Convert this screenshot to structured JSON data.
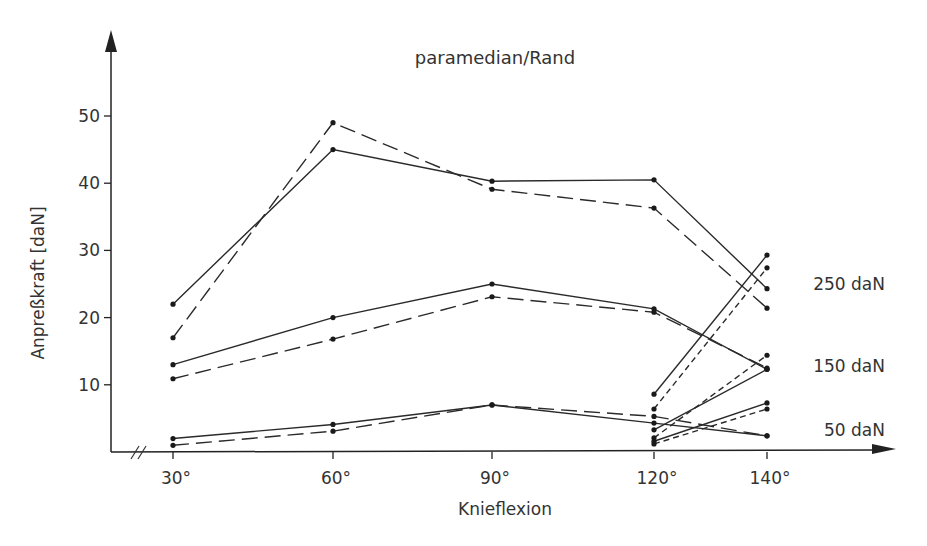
{
  "chart_data": {
    "type": "line",
    "title": "paramedian/Rand",
    "xlabel": "Knieflexion",
    "ylabel": "Anpreßkraft [daN]",
    "x_categories": [
      "30°",
      "60°",
      "90°",
      "120°",
      "140°"
    ],
    "x": [
      30,
      60,
      90,
      120,
      140
    ],
    "yticks": [
      10,
      20,
      30,
      40,
      50
    ],
    "ylim": [
      0,
      58
    ],
    "grid": false,
    "axis_break_x": true,
    "load_labels": [
      {
        "text": "250 daN",
        "y": 25
      },
      {
        "text": "150 daN",
        "y": 12.8
      },
      {
        "text": "50 daN",
        "y": 3.3
      }
    ],
    "series": [
      {
        "name": "250 daN paramedian (solid)",
        "group": "250 daN",
        "style": "solid",
        "x": [
          30,
          60,
          90,
          120,
          140
        ],
        "values": [
          22.0,
          45.0,
          40.3,
          40.5,
          24.3
        ]
      },
      {
        "name": "250 daN paramedian (long dash)",
        "group": "250 daN",
        "style": "longdash",
        "x": [
          30,
          60,
          90,
          120,
          140
        ],
        "values": [
          17.0,
          49.0,
          39.1,
          36.3,
          21.4
        ]
      },
      {
        "name": "150 daN paramedian (solid)",
        "group": "150 daN",
        "style": "solid",
        "x": [
          30,
          60,
          90,
          120,
          140
        ],
        "values": [
          13.0,
          20.0,
          25.0,
          21.3,
          12.3
        ]
      },
      {
        "name": "150 daN paramedian (long dash)",
        "group": "150 daN",
        "style": "longdash",
        "x": [
          30,
          60,
          90,
          120,
          140
        ],
        "values": [
          10.9,
          16.8,
          23.1,
          20.8,
          12.5
        ]
      },
      {
        "name": "50 daN paramedian (solid)",
        "group": "50 daN",
        "style": "solid",
        "x": [
          30,
          60,
          90,
          120,
          140
        ],
        "values": [
          2.0,
          4.1,
          7.0,
          4.3,
          2.4
        ]
      },
      {
        "name": "50 daN paramedian (long dash)",
        "group": "50 daN",
        "style": "longdash",
        "x": [
          30,
          60,
          90,
          120,
          140
        ],
        "values": [
          1.0,
          3.1,
          7.0,
          5.3,
          2.4
        ]
      },
      {
        "name": "250 daN Rand (solid)",
        "group": "250 daN",
        "style": "solid",
        "x": [
          120,
          140
        ],
        "values": [
          8.6,
          29.3
        ]
      },
      {
        "name": "250 daN Rand (short dash)",
        "group": "250 daN",
        "style": "shortdash",
        "x": [
          120,
          140
        ],
        "values": [
          6.4,
          27.4
        ]
      },
      {
        "name": "150 daN Rand (solid)",
        "group": "150 daN",
        "style": "solid",
        "x": [
          120,
          140
        ],
        "values": [
          3.3,
          12.3
        ]
      },
      {
        "name": "150 daN Rand (short dash)",
        "group": "150 daN",
        "style": "shortdash",
        "x": [
          120,
          140
        ],
        "values": [
          2.1,
          14.4
        ]
      },
      {
        "name": "50 daN Rand (solid)",
        "group": "50 daN",
        "style": "solid",
        "x": [
          120,
          140
        ],
        "values": [
          1.6,
          7.3
        ]
      },
      {
        "name": "50 daN Rand (short dash)",
        "group": "50 daN",
        "style": "shortdash",
        "x": [
          120,
          140
        ],
        "values": [
          1.2,
          6.4
        ]
      }
    ]
  },
  "layout": {
    "x_pixels": {
      "30": 173,
      "60": 333,
      "90": 492,
      "120": 654,
      "140": 767
    },
    "y_zero_px": 452,
    "px_per_unit": 6.72
  }
}
